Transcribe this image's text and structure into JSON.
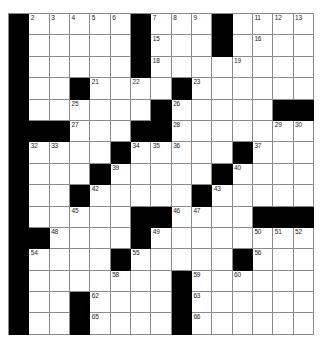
{
  "puzzle": {
    "type": "crossword-grid",
    "rows": 15,
    "columns": 15,
    "colors": {
      "block": "#000000",
      "cell": "#ffffff",
      "gridline": "#8a8a8a",
      "number": "#1a1a1a",
      "background": "#ffffff"
    },
    "blocks": [
      [
        0,
        6,
        10
      ],
      [
        0,
        6,
        10
      ],
      [
        0,
        6
      ],
      [
        0,
        3,
        8
      ],
      [
        0,
        7,
        13,
        14
      ],
      [
        0,
        1,
        2,
        6,
        7
      ],
      [
        0,
        5,
        11
      ],
      [
        0,
        4,
        10
      ],
      [
        0,
        3,
        9
      ],
      [
        0,
        6,
        7,
        12,
        13,
        14
      ],
      [
        0,
        1,
        6
      ],
      [
        0,
        5,
        11
      ],
      [
        0,
        8
      ],
      [
        0,
        3,
        8
      ],
      [
        0,
        3,
        8
      ]
    ],
    "numbers": [
      {
        "row": 0,
        "col": 0,
        "n": "1"
      },
      {
        "row": 0,
        "col": 1,
        "n": "2"
      },
      {
        "row": 0,
        "col": 2,
        "n": "3"
      },
      {
        "row": 0,
        "col": 3,
        "n": "4"
      },
      {
        "row": 0,
        "col": 4,
        "n": "5"
      },
      {
        "row": 0,
        "col": 5,
        "n": "6"
      },
      {
        "row": 0,
        "col": 7,
        "n": "7"
      },
      {
        "row": 0,
        "col": 8,
        "n": "8"
      },
      {
        "row": 0,
        "col": 9,
        "n": "9"
      },
      {
        "row": 0,
        "col": 10,
        "n": "10"
      },
      {
        "row": 0,
        "col": 12,
        "n": "11"
      },
      {
        "row": 0,
        "col": 13,
        "n": "12"
      },
      {
        "row": 0,
        "col": 14,
        "n": "13"
      },
      {
        "row": 1,
        "col": 0,
        "n": "14"
      },
      {
        "row": 1,
        "col": 7,
        "n": "15"
      },
      {
        "row": 1,
        "col": 12,
        "n": "16"
      },
      {
        "row": 2,
        "col": 0,
        "n": "17"
      },
      {
        "row": 2,
        "col": 7,
        "n": "18"
      },
      {
        "row": 2,
        "col": 11,
        "n": "19"
      },
      {
        "row": 3,
        "col": 0,
        "n": "20"
      },
      {
        "row": 3,
        "col": 4,
        "n": "21"
      },
      {
        "row": 3,
        "col": 6,
        "n": "22"
      },
      {
        "row": 3,
        "col": 9,
        "n": "23"
      },
      {
        "row": 4,
        "col": 0,
        "n": "24"
      },
      {
        "row": 4,
        "col": 3,
        "n": "25"
      },
      {
        "row": 4,
        "col": 8,
        "n": "26"
      },
      {
        "row": 5,
        "col": 3,
        "n": "27"
      },
      {
        "row": 5,
        "col": 8,
        "n": "28"
      },
      {
        "row": 5,
        "col": 13,
        "n": "29"
      },
      {
        "row": 5,
        "col": 14,
        "n": "30"
      },
      {
        "row": 6,
        "col": 0,
        "n": "31"
      },
      {
        "row": 6,
        "col": 1,
        "n": "32"
      },
      {
        "row": 6,
        "col": 2,
        "n": "33"
      },
      {
        "row": 6,
        "col": 6,
        "n": "34"
      },
      {
        "row": 6,
        "col": 7,
        "n": "35"
      },
      {
        "row": 6,
        "col": 8,
        "n": "36"
      },
      {
        "row": 6,
        "col": 12,
        "n": "37"
      },
      {
        "row": 7,
        "col": 0,
        "n": "38"
      },
      {
        "row": 7,
        "col": 5,
        "n": "39"
      },
      {
        "row": 7,
        "col": 11,
        "n": "40"
      },
      {
        "row": 8,
        "col": 0,
        "n": "41"
      },
      {
        "row": 8,
        "col": 4,
        "n": "42"
      },
      {
        "row": 8,
        "col": 10,
        "n": "43"
      },
      {
        "row": 9,
        "col": 0,
        "n": "44"
      },
      {
        "row": 9,
        "col": 3,
        "n": "45"
      },
      {
        "row": 9,
        "col": 8,
        "n": "46"
      },
      {
        "row": 9,
        "col": 9,
        "n": "47"
      },
      {
        "row": 10,
        "col": 2,
        "n": "48"
      },
      {
        "row": 10,
        "col": 7,
        "n": "49"
      },
      {
        "row": 10,
        "col": 12,
        "n": "50"
      },
      {
        "row": 10,
        "col": 13,
        "n": "51"
      },
      {
        "row": 10,
        "col": 14,
        "n": "52"
      },
      {
        "row": 11,
        "col": 0,
        "n": "53"
      },
      {
        "row": 11,
        "col": 1,
        "n": "54"
      },
      {
        "row": 11,
        "col": 6,
        "n": "55"
      },
      {
        "row": 11,
        "col": 12,
        "n": "56"
      },
      {
        "row": 12,
        "col": 0,
        "n": "57"
      },
      {
        "row": 12,
        "col": 5,
        "n": "58"
      },
      {
        "row": 12,
        "col": 9,
        "n": "59"
      },
      {
        "row": 12,
        "col": 11,
        "n": "60"
      },
      {
        "row": 13,
        "col": 0,
        "n": "61"
      },
      {
        "row": 13,
        "col": 4,
        "n": "62"
      },
      {
        "row": 13,
        "col": 9,
        "n": "63"
      },
      {
        "row": 14,
        "col": 0,
        "n": "64"
      },
      {
        "row": 14,
        "col": 4,
        "n": "65"
      },
      {
        "row": 14,
        "col": 9,
        "n": "66"
      }
    ]
  }
}
